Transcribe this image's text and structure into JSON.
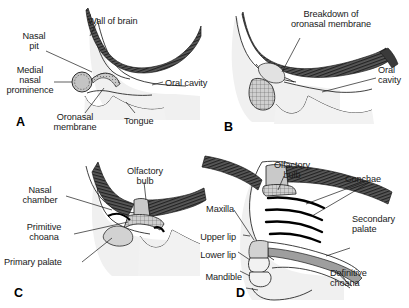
{
  "figure": {
    "panel_count": 4,
    "colors": {
      "hatch_dark": "#4a4a4a",
      "tissue_light": "#ededed",
      "tissue_mid": "#d6d6d6",
      "tissue_dark": "#b3b3b3",
      "outline": "#1a1a1a",
      "background": "#ffffff",
      "text": "#1a1a1a"
    }
  },
  "panels": [
    {
      "letter": "A",
      "labels": [
        {
          "id": "wall-of-brain",
          "text": "Wall of brain"
        },
        {
          "id": "nasal-pit",
          "text": "Nasal\npit"
        },
        {
          "id": "medial-nasal-prominence",
          "text": "Medial\nnasal\nprominence"
        },
        {
          "id": "oronasal-membrane",
          "text": "Oronasal\nmembrane"
        },
        {
          "id": "oral-cavity",
          "text": "Oral cavity"
        },
        {
          "id": "tongue",
          "text": "Tongue"
        }
      ]
    },
    {
      "letter": "B",
      "labels": [
        {
          "id": "breakdown-of-oronasal-membrane",
          "text": "Breakdown of\noronasal membrane"
        },
        {
          "id": "oral-cavity",
          "text": "Oral\ncavity"
        }
      ]
    },
    {
      "letter": "C",
      "labels": [
        {
          "id": "olfactory-bulb",
          "text": "Olfactory\nbulb"
        },
        {
          "id": "nasal-chamber",
          "text": "Nasal\nchamber"
        },
        {
          "id": "primitive-choana",
          "text": "Primitive\nchoana"
        },
        {
          "id": "primary-palate",
          "text": "Primary palate"
        }
      ]
    },
    {
      "letter": "D",
      "labels": [
        {
          "id": "olfactory-bulb",
          "text": "Olfactory\nbulb"
        },
        {
          "id": "conchae",
          "text": "Conchae"
        },
        {
          "id": "maxilla",
          "text": "Maxilla"
        },
        {
          "id": "upper-lip",
          "text": "Upper lip"
        },
        {
          "id": "lower-lip",
          "text": "Lower lip"
        },
        {
          "id": "mandible",
          "text": "Mandible"
        },
        {
          "id": "secondary-palate",
          "text": "Secondary\npalate"
        },
        {
          "id": "definitive-choana",
          "text": "Definitive\nchoana"
        }
      ]
    }
  ]
}
